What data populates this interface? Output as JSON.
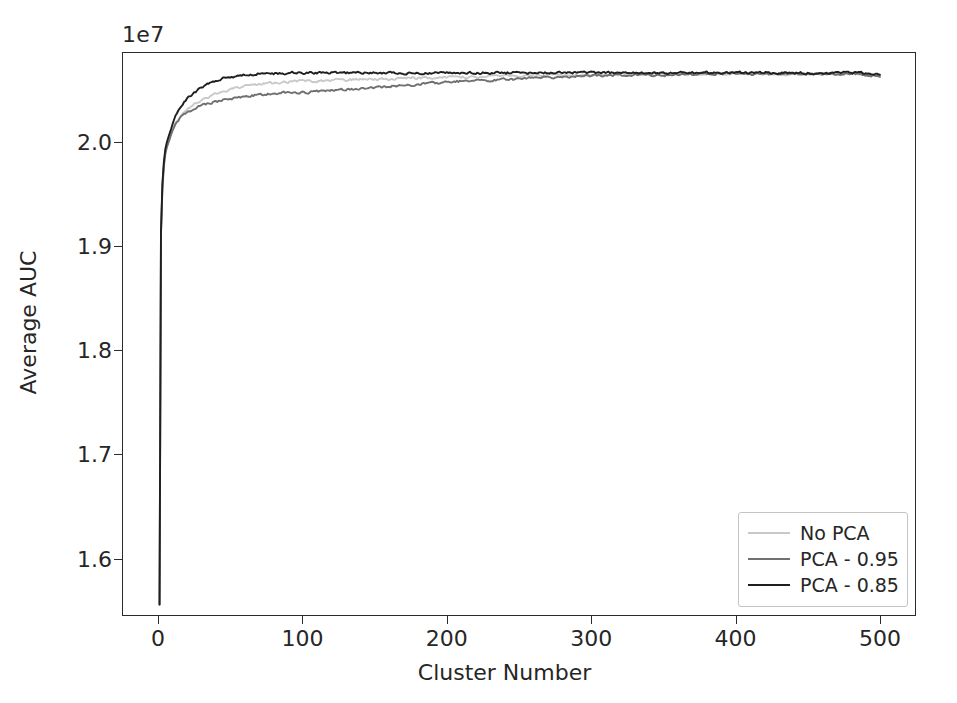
{
  "chart_data": {
    "type": "line",
    "title": "",
    "xlabel": "Cluster Number",
    "ylabel": "Average AUC",
    "y_offset_label": "1e7",
    "y_offset_value": 10000000,
    "xlim": [
      -25,
      525
    ],
    "ylim": [
      1.545,
      2.086
    ],
    "xticks": [
      0,
      100,
      200,
      300,
      400,
      500
    ],
    "xtick_labels": [
      "0",
      "100",
      "200",
      "300",
      "400",
      "500"
    ],
    "yticks": [
      1.6,
      1.7,
      1.8,
      1.9,
      2.0
    ],
    "ytick_labels": [
      "1.6",
      "1.7",
      "1.8",
      "1.9",
      "2.0"
    ],
    "grid": false,
    "legend_position": "lower right",
    "x": [
      1,
      2,
      3,
      4,
      5,
      6,
      8,
      10,
      12,
      15,
      18,
      21,
      25,
      30,
      35,
      40,
      45,
      50,
      60,
      70,
      80,
      90,
      100,
      110,
      120,
      130,
      140,
      150,
      160,
      170,
      180,
      190,
      200,
      210,
      220,
      230,
      240,
      250,
      260,
      270,
      280,
      290,
      300,
      320,
      340,
      360,
      380,
      400,
      420,
      440,
      460,
      480,
      500
    ],
    "series": [
      {
        "name": "No PCA",
        "color": "#c9c9c9",
        "values": [
          1.556,
          1.912,
          1.958,
          1.978,
          1.99,
          1.996,
          2.004,
          2.012,
          2.018,
          2.024,
          2.029,
          2.032,
          2.036,
          2.04,
          2.043,
          2.046,
          2.048,
          2.05,
          2.053,
          2.055,
          2.056,
          2.057,
          2.058,
          2.058,
          2.059,
          2.059,
          2.06,
          2.06,
          2.06,
          2.061,
          2.061,
          2.061,
          2.062,
          2.062,
          2.062,
          2.063,
          2.063,
          2.063,
          2.064,
          2.064,
          2.064,
          2.064,
          2.064,
          2.065,
          2.065,
          2.065,
          2.065,
          2.065,
          2.065,
          2.065,
          2.065,
          2.065,
          2.064
        ]
      },
      {
        "name": "PCA - 0.95",
        "color": "#707070",
        "values": [
          1.556,
          1.91,
          1.955,
          1.976,
          1.988,
          1.994,
          2.002,
          2.01,
          2.016,
          2.022,
          2.026,
          2.029,
          2.032,
          2.035,
          2.037,
          2.038,
          2.04,
          2.041,
          2.043,
          2.045,
          2.046,
          2.047,
          2.047,
          2.048,
          2.049,
          2.05,
          2.051,
          2.052,
          2.053,
          2.054,
          2.055,
          2.056,
          2.057,
          2.058,
          2.058,
          2.059,
          2.06,
          2.06,
          2.061,
          2.062,
          2.062,
          2.063,
          2.063,
          2.064,
          2.064,
          2.064,
          2.065,
          2.065,
          2.065,
          2.065,
          2.065,
          2.065,
          2.063
        ]
      },
      {
        "name": "PCA - 0.85",
        "color": "#1f1f1f",
        "values": [
          1.556,
          1.914,
          1.96,
          1.981,
          1.993,
          1.999,
          2.008,
          2.017,
          2.024,
          2.032,
          2.038,
          2.042,
          2.047,
          2.052,
          2.056,
          2.059,
          2.061,
          2.062,
          2.064,
          2.065,
          2.065,
          2.066,
          2.066,
          2.066,
          2.066,
          2.066,
          2.066,
          2.066,
          2.066,
          2.066,
          2.066,
          2.066,
          2.066,
          2.066,
          2.066,
          2.066,
          2.066,
          2.066,
          2.066,
          2.066,
          2.066,
          2.066,
          2.066,
          2.066,
          2.066,
          2.066,
          2.066,
          2.066,
          2.066,
          2.066,
          2.066,
          2.066,
          2.065
        ]
      }
    ],
    "noise_amplitude": 0.0018
  },
  "legend": {
    "items": [
      {
        "label": "No PCA",
        "color": "#c9c9c9"
      },
      {
        "label": "PCA - 0.95",
        "color": "#707070"
      },
      {
        "label": "PCA - 0.85",
        "color": "#1f1f1f"
      }
    ]
  }
}
